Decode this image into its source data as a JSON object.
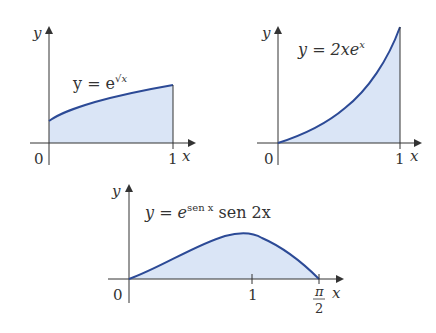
{
  "colors": {
    "fill": "#dae5f6",
    "curve": "#2c4a96",
    "axis": "#333333",
    "background": "#ffffff"
  },
  "graphs": [
    {
      "id": "graph-1",
      "equation": {
        "lhs": "y = e",
        "superscript": "√x"
      },
      "y_label": "y",
      "x_label": "x",
      "origin_label": "0",
      "ticks": [
        "1"
      ],
      "domain": [
        0,
        1
      ],
      "function": "e^sqrt(x)"
    },
    {
      "id": "graph-2",
      "equation": {
        "lhs": "y = 2xe",
        "superscript": "x"
      },
      "y_label": "y",
      "x_label": "x",
      "origin_label": "0",
      "ticks": [
        "1"
      ],
      "domain": [
        0,
        1
      ],
      "function": "2x e^x"
    },
    {
      "id": "graph-3",
      "equation": {
        "lhs": "y = e",
        "superscript": "sen x",
        "rhs": " sen 2x"
      },
      "y_label": "y",
      "x_label": "x",
      "origin_label": "0",
      "ticks": [
        "1",
        "π",
        "2"
      ],
      "domain": [
        0,
        1.5708
      ],
      "function": "e^sin(x) sin(2x)"
    }
  ]
}
